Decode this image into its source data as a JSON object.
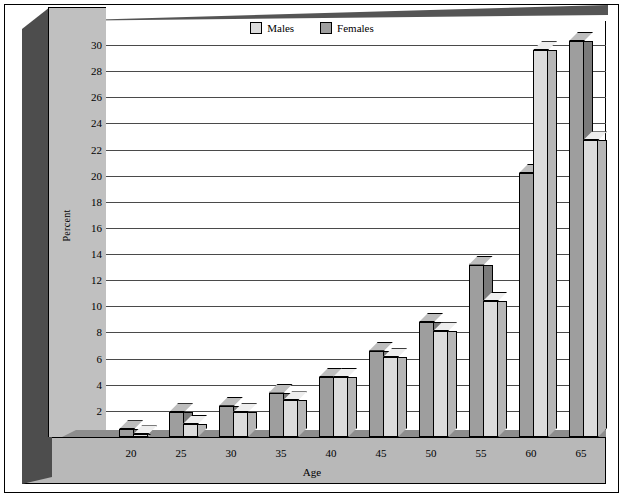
{
  "chart_data": {
    "type": "bar",
    "title": "",
    "xlabel": "Age",
    "ylabel": "Percent",
    "ylim": [
      0,
      30
    ],
    "ystep": 2,
    "grid": true,
    "legend_position": "top-center",
    "style": "3d-grouped-bar",
    "categories": [
      "20",
      "25",
      "30",
      "35",
      "40",
      "45",
      "50",
      "55",
      "60",
      "65"
    ],
    "yticks": [
      "0",
      "2",
      "4",
      "6",
      "8",
      "10",
      "12",
      "14",
      "16",
      "18",
      "20",
      "22",
      "24",
      "26",
      "28",
      "30"
    ],
    "series": [
      {
        "name": "Males",
        "color": "#dcdcdc",
        "values": [
          0.2,
          1.0,
          1.9,
          2.8,
          4.6,
          6.1,
          8.1,
          10.4,
          29.6,
          22.7
        ]
      },
      {
        "name": "Females",
        "color": "#9e9e9e",
        "values": [
          0.3,
          1.6,
          2.4,
          3.3,
          4.0,
          5.4,
          7.0,
          11.9,
          16.0,
          16.0
        ]
      }
    ],
    "back_series": {
      "name": "Females-back",
      "color": "#9e9e9e",
      "values": [
        0.6,
        1.9,
        2.4,
        3.4,
        4.6,
        6.6,
        8.8,
        13.2,
        20.2,
        30.3
      ]
    }
  },
  "legend": {
    "items": [
      {
        "label": "Males",
        "color": "#dcdcdc"
      },
      {
        "label": "Females",
        "color": "#9e9e9e"
      }
    ]
  },
  "axes": {
    "y_title": "Percent",
    "x_title": "Age"
  },
  "colors": {
    "bar_light": "#dcdcdc",
    "bar_light_side": "#b6b6b6",
    "bar_light_top": "#eeeeee",
    "bar_dark": "#9e9e9e",
    "bar_dark_side": "#7a7a7a",
    "bar_dark_top": "#bdbdbd",
    "panel": "#c0c0c0",
    "wall_shadow": "#4d4d4d",
    "floor": "#b8b8b8",
    "grid": "#4a4a4a",
    "plot_bg": "#ffffff"
  }
}
